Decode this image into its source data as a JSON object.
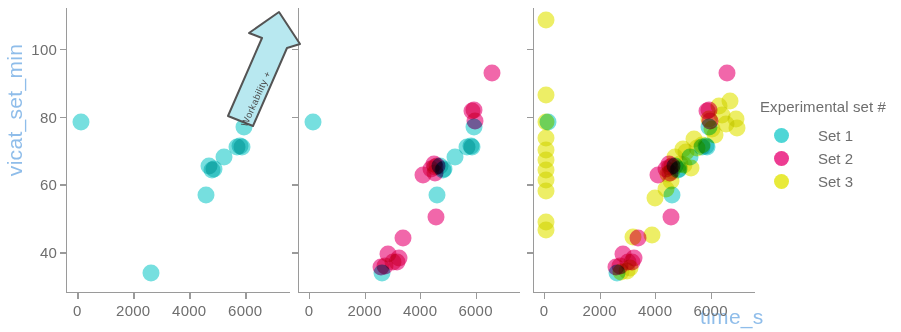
{
  "chart_data": {
    "type": "scatter",
    "title": "",
    "xlabel": "time_s",
    "ylabel": "vicat_set_min",
    "xlim": [
      -400,
      7600
    ],
    "ylim": [
      28,
      112
    ],
    "xticks": [
      0,
      2000,
      4000,
      6000
    ],
    "yticks": [
      40,
      60,
      80,
      100
    ],
    "xticklabels": [
      "0",
      "2000",
      "4000",
      "6000"
    ],
    "yticklabels": [
      "40",
      "60",
      "80",
      "100"
    ],
    "grid": false,
    "legend_position": "right",
    "legend_title": "Experimental set #",
    "panel_count": 3,
    "panels": [
      {
        "index": 0,
        "visible_series": [
          "Set 1"
        ],
        "annotation": {
          "text": "Workability +",
          "kind": "arrow",
          "direction": "up-right"
        }
      },
      {
        "index": 1,
        "visible_series": [
          "Set 1",
          "Set 2"
        ]
      },
      {
        "index": 2,
        "visible_series": [
          "Set 1",
          "Set 2",
          "Set 3"
        ]
      }
    ],
    "series": [
      {
        "name": "Set 1",
        "color": "#4fd6d6",
        "points": [
          [
            150,
            78.5
          ],
          [
            2640,
            34.0
          ],
          [
            4610,
            57.0
          ],
          [
            4700,
            65.5
          ],
          [
            4830,
            64.2
          ],
          [
            4870,
            64.5
          ],
          [
            5260,
            68.2
          ],
          [
            5700,
            71.0
          ],
          [
            5820,
            71.2
          ],
          [
            5880,
            71.0
          ],
          [
            5950,
            77.0
          ]
        ]
      },
      {
        "name": "Set 2",
        "color": "#ed3c92",
        "points": [
          [
            2600,
            35.6
          ],
          [
            2720,
            36.0
          ],
          [
            2830,
            39.6
          ],
          [
            3040,
            37.0
          ],
          [
            3150,
            37.2
          ],
          [
            3250,
            38.4
          ],
          [
            3380,
            44.2
          ],
          [
            4090,
            62.8
          ],
          [
            4400,
            64.6
          ],
          [
            4500,
            66.0
          ],
          [
            4520,
            63.4
          ],
          [
            4540,
            65.0
          ],
          [
            4560,
            50.5
          ],
          [
            4620,
            65.4
          ],
          [
            5880,
            81.6
          ],
          [
            5950,
            82.0
          ],
          [
            5980,
            78.6
          ],
          [
            6580,
            92.8
          ]
        ]
      },
      {
        "name": "Set 3",
        "color": "#e8ea3a",
        "points": [
          [
            60,
            108.5
          ],
          [
            60,
            86.5
          ],
          [
            60,
            78.4
          ],
          [
            60,
            73.8
          ],
          [
            60,
            70.2
          ],
          [
            60,
            67.2
          ],
          [
            60,
            64.4
          ],
          [
            60,
            61.2
          ],
          [
            60,
            58.0
          ],
          [
            60,
            49.0
          ],
          [
            60,
            46.6
          ],
          [
            2780,
            34.2
          ],
          [
            2980,
            34.6
          ],
          [
            3080,
            35.4
          ],
          [
            3200,
            44.4
          ],
          [
            3900,
            45.0
          ],
          [
            4000,
            56.0
          ],
          [
            4400,
            58.6
          ],
          [
            4480,
            63.0
          ],
          [
            4560,
            61.0
          ],
          [
            4620,
            64.0
          ],
          [
            4720,
            68.2
          ],
          [
            4900,
            66.0
          ],
          [
            5000,
            70.4
          ],
          [
            5050,
            65.6
          ],
          [
            5120,
            69.6
          ],
          [
            5300,
            64.8
          ],
          [
            5400,
            73.4
          ],
          [
            5500,
            70.6
          ],
          [
            5700,
            71.6
          ],
          [
            5950,
            79.4
          ],
          [
            6050,
            76.2
          ],
          [
            6150,
            74.6
          ],
          [
            6300,
            83.0
          ],
          [
            6400,
            80.4
          ],
          [
            6550,
            77.8
          ],
          [
            6700,
            84.6
          ],
          [
            6900,
            79.4
          ],
          [
            6950,
            76.6
          ]
        ]
      }
    ]
  },
  "legend": {
    "title": "Experimental set #",
    "entries": [
      {
        "label": "Set 1",
        "color": "#4fd6d6"
      },
      {
        "label": "Set 2",
        "color": "#ed3c92"
      },
      {
        "label": "Set 3",
        "color": "#e8ea3a"
      }
    ]
  },
  "axis_titles": {
    "x": "time_s",
    "y": "vicat_set_min",
    "color": "#8fbdea"
  },
  "annotation": {
    "label": "Workability +"
  }
}
